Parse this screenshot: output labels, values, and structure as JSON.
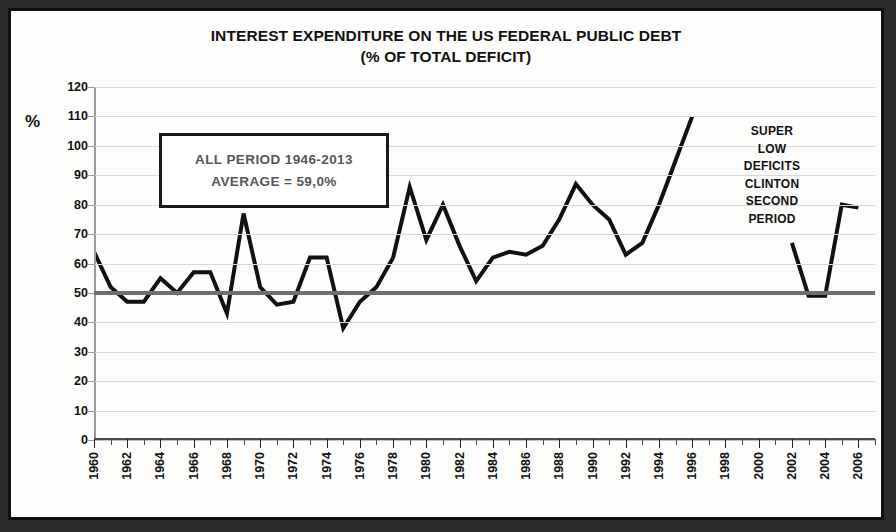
{
  "chart_data": {
    "type": "line",
    "title": "INTEREST EXPENDITURE ON THE US FEDERAL PUBLIC DEBT",
    "subtitle": "(% OF TOTAL DEFICIT)",
    "xlabel": "",
    "ylabel": "%",
    "ylim": [
      0,
      120
    ],
    "xlim": [
      1960,
      2007
    ],
    "ytick_step": 10,
    "yticks": [
      0,
      10,
      20,
      30,
      40,
      50,
      60,
      70,
      80,
      90,
      100,
      110,
      120
    ],
    "xticks": [
      1960,
      1962,
      1964,
      1966,
      1968,
      1970,
      1972,
      1974,
      1976,
      1978,
      1980,
      1982,
      1984,
      1986,
      1988,
      1990,
      1992,
      1994,
      1996,
      1998,
      2000,
      2002,
      2004,
      2006
    ],
    "grid": true,
    "legend": "none",
    "series": [
      {
        "name": "Interest expenditure (% of total deficit)",
        "color": "#111111",
        "x": [
          1960,
          1961,
          1962,
          1963,
          1964,
          1965,
          1966,
          1967,
          1968,
          1969,
          1970,
          1971,
          1972,
          1973,
          1974,
          1975,
          1976,
          1977,
          1978,
          1979,
          1980,
          1981,
          1982,
          1983,
          1984,
          1985,
          1986,
          1987,
          1988,
          1989,
          1990,
          1991,
          1992,
          1993,
          1994,
          1995,
          1996
        ],
        "values": [
          64,
          52,
          47,
          47,
          55,
          50,
          57,
          57,
          43,
          77,
          52,
          46,
          47,
          62,
          62,
          38,
          47,
          52,
          62,
          86,
          68,
          80,
          66,
          54,
          62,
          64,
          63,
          66,
          75,
          87,
          80,
          75,
          63,
          67,
          80,
          95,
          110
        ]
      },
      {
        "name": "Interest expenditure (% of total deficit) — later period",
        "color": "#111111",
        "x": [
          2002,
          2003,
          2004,
          2005,
          2006
        ],
        "values": [
          67,
          49,
          49,
          80,
          79
        ]
      }
    ],
    "reference_line": {
      "label": "average",
      "value": 50,
      "color": "#6e6e70"
    },
    "annotations": [
      {
        "name": "average-box",
        "lines": [
          "ALL PERIOD 1946-2013",
          "AVERAGE = 59,0%"
        ]
      },
      {
        "name": "clinton-note",
        "lines": [
          "SUPER",
          "LOW",
          "DEFICITS",
          "CLINTON",
          "SECOND",
          "PERIOD"
        ]
      }
    ]
  },
  "title": {
    "line1": "INTEREST EXPENDITURE ON THE US FEDERAL PUBLIC DEBT",
    "line2": "(% OF TOTAL DEFICIT)"
  },
  "axis": {
    "y_unit": "%"
  },
  "avg_box": {
    "line1": "ALL PERIOD 1946-2013",
    "line2": "AVERAGE = 59,0%"
  },
  "clinton_note": {
    "line1": "SUPER",
    "line2": "LOW",
    "line3": "DEFICITS",
    "line4": "CLINTON",
    "line5": "SECOND",
    "line6": "PERIOD"
  }
}
